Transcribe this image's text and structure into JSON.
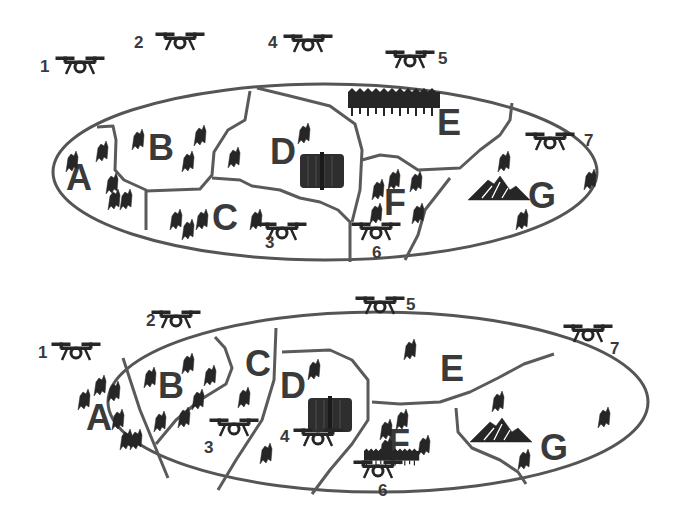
{
  "diagram": {
    "colors": {
      "border": "#555555",
      "ink": "#262626",
      "label": "#3a3a3a",
      "background": "#ffffff"
    },
    "top_map": {
      "regions": [
        {
          "id": "A",
          "label": "A",
          "features": [
            "people-icons"
          ]
        },
        {
          "id": "B",
          "label": "B",
          "features": [
            "people-icons"
          ]
        },
        {
          "id": "C",
          "label": "C",
          "features": [
            "people-icons"
          ]
        },
        {
          "id": "D",
          "label": "D",
          "features": [
            "building-icon",
            "people-icon"
          ]
        },
        {
          "id": "E",
          "label": "E",
          "features": [
            "forest-icon"
          ]
        },
        {
          "id": "F",
          "label": "F",
          "features": [
            "people-icons"
          ]
        },
        {
          "id": "G",
          "label": "G",
          "features": [
            "mountain-icon",
            "people-icons"
          ]
        }
      ],
      "drones": [
        {
          "id": "1",
          "label": "1"
        },
        {
          "id": "2",
          "label": "2"
        },
        {
          "id": "3",
          "label": "3"
        },
        {
          "id": "4",
          "label": "4"
        },
        {
          "id": "5",
          "label": "5"
        },
        {
          "id": "6",
          "label": "6"
        },
        {
          "id": "7",
          "label": "7"
        }
      ]
    },
    "bottom_map": {
      "regions": [
        {
          "id": "A",
          "label": "A",
          "features": [
            "people-icons"
          ]
        },
        {
          "id": "B",
          "label": "B",
          "features": [
            "people-icons"
          ]
        },
        {
          "id": "C",
          "label": "C",
          "features": [
            "people-icon"
          ]
        },
        {
          "id": "D",
          "label": "D",
          "features": [
            "building-icon",
            "people-icon"
          ]
        },
        {
          "id": "E",
          "label": "E",
          "features": [
            "people-icon"
          ]
        },
        {
          "id": "F",
          "label": "F",
          "features": [
            "people-icons"
          ]
        },
        {
          "id": "G",
          "label": "G",
          "features": [
            "mountain-icon",
            "forest-icon",
            "people-icons"
          ]
        }
      ],
      "drones": [
        {
          "id": "1",
          "label": "1"
        },
        {
          "id": "2",
          "label": "2"
        },
        {
          "id": "3",
          "label": "3"
        },
        {
          "id": "4",
          "label": "4"
        },
        {
          "id": "5",
          "label": "5"
        },
        {
          "id": "6",
          "label": "6"
        },
        {
          "id": "7",
          "label": "7"
        }
      ]
    }
  }
}
